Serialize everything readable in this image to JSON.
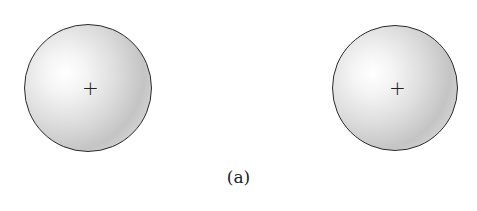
{
  "figure": {
    "caption": "(a)",
    "charges": [
      {
        "label": "+",
        "sign": "positive",
        "cx": 88,
        "cy": 88,
        "r": 64
      },
      {
        "label": "+",
        "sign": "positive",
        "cx": 395,
        "cy": 88,
        "r": 63
      }
    ],
    "colors": {
      "outline": "#2a2a2a",
      "fill_light": "#ffffff",
      "fill_dark": "#c4c4c4"
    }
  }
}
